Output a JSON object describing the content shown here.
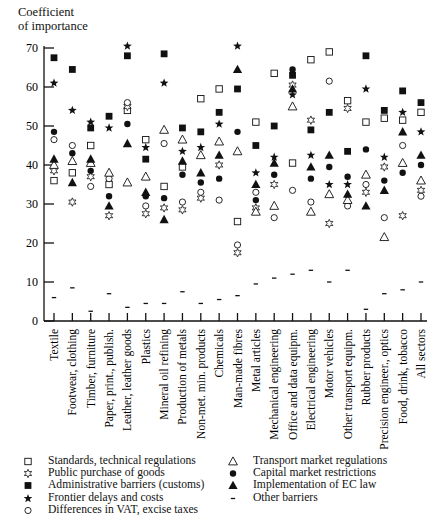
{
  "chart_data": {
    "type": "scatter",
    "title": "",
    "ylabel": "Coefficient of importance",
    "ylabel_lines": [
      "Coefficient",
      "of importance"
    ],
    "xlabel": "",
    "ylim": [
      0,
      70
    ],
    "yticks": [
      0,
      10,
      20,
      30,
      40,
      50,
      60,
      70
    ],
    "grid": false,
    "legend_position": "bottom",
    "categories": [
      "Textile",
      "Footwear, clothing",
      "Timber, furniture",
      "Paper, print., publish.",
      "Leather, leather goods",
      "Plastics",
      "Mineral oil refining",
      "Production of metals",
      "Non-met. min. products",
      "Chemicals",
      "Man-made fibres",
      "Metal articles",
      "Mechanical engineering",
      "Office and data equipm.",
      "Electrical engineering",
      "Motor vehicles",
      "Other transport equipm.",
      "Rubber products",
      "Precision engineer., optics",
      "Food, drink, tobacco",
      "All sectors"
    ],
    "series": [
      {
        "name": "Standards, technical regulations",
        "marker": "open-square",
        "values": [
          36,
          38,
          45,
          35,
          54,
          46.5,
          34.5,
          39.5,
          57,
          59.5,
          25.5,
          51,
          63.5,
          40.5,
          67,
          69,
          56.5,
          51,
          52,
          51.5,
          53.5
        ]
      },
      {
        "name": "Public purchase of goods",
        "marker": "open-star",
        "values": [
          38.5,
          30.5,
          37,
          27,
          55,
          27.5,
          29,
          28.5,
          31.5,
          40,
          17.5,
          29,
          35,
          60.5,
          51.5,
          25,
          54.5,
          33,
          39.5,
          27,
          33.5
        ]
      },
      {
        "name": "Administrative barriers (customs)",
        "marker": "filled-square",
        "values": [
          67.5,
          64.5,
          49.5,
          52.5,
          68,
          41.5,
          68.5,
          49.5,
          48.5,
          53.5,
          59.5,
          45,
          50,
          63,
          49,
          53.5,
          43.5,
          68,
          54,
          59,
          56
        ]
      },
      {
        "name": "Frontier delays and costs",
        "marker": "filled-star",
        "values": [
          61,
          54,
          51,
          49.5,
          70.5,
          44.5,
          61,
          43.5,
          44.5,
          50.5,
          70.5,
          38,
          42,
          58,
          42.5,
          35,
          35,
          59.5,
          42,
          53.5,
          48.5
        ]
      },
      {
        "name": "Differences in VAT, excise taxes",
        "marker": "open-circle",
        "values": [
          46.5,
          45,
          34.5,
          36.5,
          56,
          29.5,
          45.5,
          30.5,
          33,
          31,
          19.5,
          33,
          26.5,
          33.5,
          30.5,
          61.5,
          29.5,
          35,
          26.5,
          45,
          32
        ]
      },
      {
        "name": "Transport market regulations",
        "marker": "open-triangle",
        "values": [
          40,
          41,
          40.5,
          38,
          35.5,
          37,
          49,
          46.5,
          42.5,
          46,
          43.5,
          28,
          29.5,
          55,
          28,
          32.5,
          31,
          37.5,
          21.5,
          40.5,
          36
        ]
      },
      {
        "name": "Capital market restrictions",
        "marker": "filled-circle",
        "values": [
          48.5,
          43,
          38.5,
          32,
          50.5,
          32,
          31.5,
          37.5,
          35.5,
          36.5,
          48.5,
          31,
          37.5,
          64.5,
          36.5,
          39.5,
          37,
          44,
          36,
          38,
          40
        ]
      },
      {
        "name": "Implementation of EC law",
        "marker": "filled-triangle",
        "values": [
          41.5,
          35.5,
          41.5,
          29.5,
          45.5,
          33,
          26,
          41,
          38,
          42.5,
          64.5,
          35,
          40.5,
          59.5,
          39.5,
          42.5,
          32.5,
          29.5,
          33.5,
          48.5,
          42.5
        ]
      },
      {
        "name": "Other barriers",
        "marker": "dash",
        "values": [
          6,
          8.5,
          2.5,
          7,
          3.5,
          4.5,
          4.5,
          7.5,
          4.5,
          5.5,
          6.5,
          9.5,
          11,
          12,
          13,
          10,
          13,
          3,
          7,
          8,
          10
        ]
      }
    ]
  },
  "legend": {
    "left": [
      {
        "marker": "open-square",
        "label": "Standards, technical regulations"
      },
      {
        "marker": "open-star",
        "label": "Public purchase of goods"
      },
      {
        "marker": "filled-square",
        "label": "Administrative barriers (customs)"
      },
      {
        "marker": "filled-star",
        "label": "Frontier delays and costs"
      },
      {
        "marker": "open-circle",
        "label": "Differences in VAT, excise taxes"
      }
    ],
    "right": [
      {
        "marker": "open-triangle",
        "label": "Transport market regulations"
      },
      {
        "marker": "filled-circle",
        "label": "Capital market restrictions"
      },
      {
        "marker": "filled-triangle",
        "label": "Implementation of EC law"
      },
      {
        "marker": "dash",
        "label": "Other barriers"
      }
    ]
  }
}
